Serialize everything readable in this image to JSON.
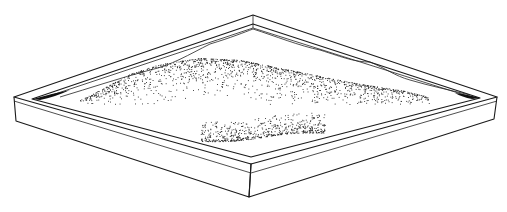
{
  "figure": {
    "title": "Sandbox tray with sand mounds",
    "colors": {
      "ink": "#1a1a1a",
      "background": "#ffffff"
    }
  },
  "tray": {
    "outer_top": [
      253,
      15
    ],
    "outer_left": [
      14,
      97
    ],
    "outer_right": [
      497,
      97
    ],
    "outer_front": [
      251,
      164
    ],
    "front_bottom": [
      249,
      197
    ],
    "left_bottom": [
      16,
      121
    ],
    "right_bottom": [
      494,
      119
    ]
  },
  "mounds": [
    {
      "name": "back-ridge",
      "density": 2600
    },
    {
      "name": "front-mound",
      "density": 900
    }
  ]
}
